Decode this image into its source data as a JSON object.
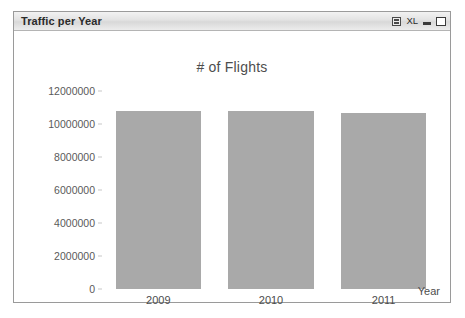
{
  "window": {
    "title": "Traffic per Year",
    "controls": [
      {
        "name": "print-icon",
        "label": ""
      },
      {
        "name": "export-excel",
        "label": "XL"
      },
      {
        "name": "minimize-icon",
        "label": ""
      },
      {
        "name": "maximize-icon",
        "label": ""
      }
    ]
  },
  "chart_data": {
    "type": "bar",
    "title": "# of Flights",
    "xlabel": "Year",
    "ylabel": "",
    "categories": [
      "2009",
      "2010",
      "2011"
    ],
    "values": [
      10800000,
      10800000,
      10650000
    ],
    "ylim": [
      0,
      12000000
    ],
    "yticks": [
      0,
      2000000,
      4000000,
      6000000,
      8000000,
      10000000,
      12000000
    ],
    "ytick_labels": [
      "0",
      "2000000",
      "4000000",
      "6000000",
      "8000000",
      "10000000",
      "12000000"
    ],
    "grid": false,
    "legend": null,
    "bar_color": "#a9a9a9",
    "text_color": "#4d4d4d"
  }
}
